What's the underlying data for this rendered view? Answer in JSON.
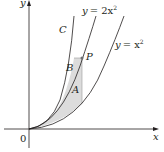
{
  "diagram": {
    "axes": {
      "x_label": "x",
      "y_label": "y",
      "origin_label": "0"
    },
    "curves": [
      {
        "id": "C",
        "label": "C"
      },
      {
        "id": "upper",
        "label_y": "y",
        "label_eq": "= 2x",
        "label_exp": "2"
      },
      {
        "id": "lower",
        "label_y": "y",
        "label_eq": "= x",
        "label_exp": "2"
      }
    ],
    "point": {
      "label": "P"
    },
    "regions": [
      {
        "label": "B",
        "color": "#d9d9d9"
      },
      {
        "label": "A",
        "color": "#d9d9d9"
      }
    ],
    "colors": {
      "stroke": "#231f20",
      "shade": "#d9d9d9",
      "point": "#6d6e71"
    }
  }
}
